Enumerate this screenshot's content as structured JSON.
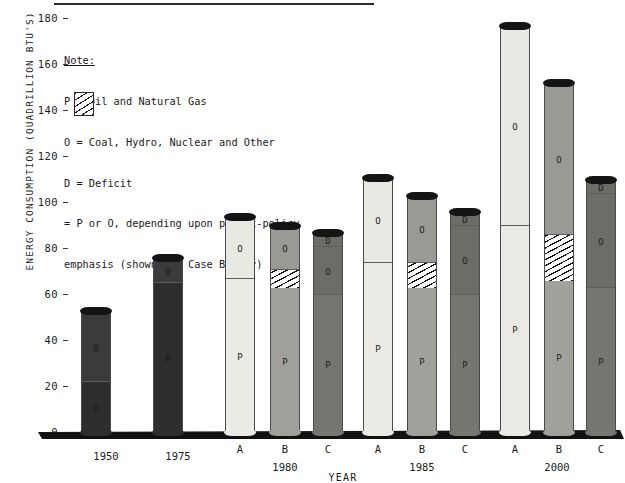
{
  "axes": {
    "ylabel": "ENERGY CONSUMPTION (QUADRILLION BTU'S)",
    "xlabel": "YEAR",
    "yticks": [
      0,
      20,
      40,
      60,
      80,
      100,
      120,
      140,
      160,
      180
    ],
    "ylim": [
      0,
      180
    ]
  },
  "note": {
    "title": "Note:",
    "line_p": "P = Oil and Natural Gas",
    "line_o": "O = Coal, Hydro, Nuclear and Other",
    "line_d": "D = Deficit",
    "line_hatch_1": "= P or O, depending upon public-policy",
    "line_hatch_2": "emphasis (shown for Case B only)"
  },
  "chart_data": {
    "type": "bar",
    "title": "",
    "xlabel": "YEAR",
    "ylabel": "ENERGY CONSUMPTION (QUADRILLION BTU'S)",
    "ylim": [
      0,
      180
    ],
    "yticks": [
      0,
      20,
      40,
      60,
      80,
      100,
      120,
      140,
      160,
      180
    ],
    "grid": false,
    "legend_position": "inside-top-left",
    "stacking": "stacked",
    "segment_labels": {
      "P": "P",
      "O": "O",
      "D": "D"
    },
    "groups": [
      {
        "group": "1950",
        "group_label": "1950",
        "bars": [
          {
            "case": "",
            "tone": "dark",
            "total": 53,
            "segments": [
              {
                "label": "P",
                "from": 0,
                "to": 22,
                "value": 22,
                "fill": "solid-dark"
              },
              {
                "label": "O",
                "from": 22,
                "to": 53,
                "value": 31,
                "fill": "solid-dark"
              }
            ]
          }
        ]
      },
      {
        "group": "1975",
        "group_label": "1975",
        "bars": [
          {
            "case": "",
            "tone": "dark",
            "total": 76,
            "segments": [
              {
                "label": "P",
                "from": 0,
                "to": 65,
                "value": 65,
                "fill": "solid-dark"
              },
              {
                "label": "O",
                "from": 65,
                "to": 76,
                "value": 11,
                "fill": "solid-dark"
              }
            ]
          }
        ]
      },
      {
        "group": "1980",
        "group_label": "1980",
        "bars": [
          {
            "case": "A",
            "tone": "light",
            "total": 94,
            "segments": [
              {
                "label": "P",
                "from": 0,
                "to": 67,
                "value": 67,
                "fill": "solid-light"
              },
              {
                "label": "O",
                "from": 67,
                "to": 94,
                "value": 27,
                "fill": "solid-light"
              }
            ]
          },
          {
            "case": "B",
            "tone": "mid",
            "total": 90,
            "segments": [
              {
                "label": "P",
                "from": 0,
                "to": 63,
                "value": 63,
                "fill": "solid-mid"
              },
              {
                "label": "",
                "from": 63,
                "to": 71,
                "value": 8,
                "fill": "hatched"
              },
              {
                "label": "O",
                "from": 71,
                "to": 90,
                "value": 19,
                "fill": "solid-mid"
              }
            ]
          },
          {
            "case": "C",
            "tone": "deep",
            "total": 87,
            "segments": [
              {
                "label": "P",
                "from": 0,
                "to": 60,
                "value": 60,
                "fill": "solid-deep"
              },
              {
                "label": "O",
                "from": 60,
                "to": 81,
                "value": 21,
                "fill": "solid-deep"
              },
              {
                "label": "D",
                "from": 81,
                "to": 87,
                "value": 6,
                "fill": "solid-deep"
              }
            ]
          }
        ]
      },
      {
        "group": "1985",
        "group_label": "1985",
        "bars": [
          {
            "case": "A",
            "tone": "light",
            "total": 111,
            "segments": [
              {
                "label": "P",
                "from": 0,
                "to": 74,
                "value": 74,
                "fill": "solid-light"
              },
              {
                "label": "O",
                "from": 74,
                "to": 111,
                "value": 37,
                "fill": "solid-light"
              }
            ]
          },
          {
            "case": "B",
            "tone": "mid",
            "total": 103,
            "segments": [
              {
                "label": "P",
                "from": 0,
                "to": 63,
                "value": 63,
                "fill": "solid-mid"
              },
              {
                "label": "",
                "from": 63,
                "to": 74,
                "value": 11,
                "fill": "hatched"
              },
              {
                "label": "O",
                "from": 74,
                "to": 103,
                "value": 29,
                "fill": "solid-mid"
              }
            ]
          },
          {
            "case": "C",
            "tone": "deep",
            "total": 96,
            "segments": [
              {
                "label": "P",
                "from": 0,
                "to": 60,
                "value": 60,
                "fill": "solid-deep"
              },
              {
                "label": "O",
                "from": 60,
                "to": 90,
                "value": 30,
                "fill": "solid-deep"
              },
              {
                "label": "D",
                "from": 90,
                "to": 96,
                "value": 6,
                "fill": "solid-deep"
              }
            ]
          }
        ]
      },
      {
        "group": "2000",
        "group_label": "2000",
        "bars": [
          {
            "case": "A",
            "tone": "light",
            "total": 177,
            "segments": [
              {
                "label": "P",
                "from": 0,
                "to": 90,
                "value": 90,
                "fill": "solid-light"
              },
              {
                "label": "O",
                "from": 90,
                "to": 177,
                "value": 87,
                "fill": "solid-light"
              }
            ]
          },
          {
            "case": "B",
            "tone": "mid",
            "total": 152,
            "segments": [
              {
                "label": "P",
                "from": 0,
                "to": 66,
                "value": 66,
                "fill": "solid-mid"
              },
              {
                "label": "",
                "from": 66,
                "to": 86,
                "value": 20,
                "fill": "hatched"
              },
              {
                "label": "O",
                "from": 86,
                "to": 152,
                "value": 66,
                "fill": "solid-mid"
              }
            ]
          },
          {
            "case": "C",
            "tone": "deep",
            "total": 110,
            "segments": [
              {
                "label": "P",
                "from": 0,
                "to": 63,
                "value": 63,
                "fill": "solid-deep"
              },
              {
                "label": "O",
                "from": 63,
                "to": 104,
                "value": 41,
                "fill": "solid-deep"
              },
              {
                "label": "D",
                "from": 104,
                "to": 110,
                "value": 6,
                "fill": "solid-deep"
              }
            ]
          }
        ]
      }
    ]
  }
}
